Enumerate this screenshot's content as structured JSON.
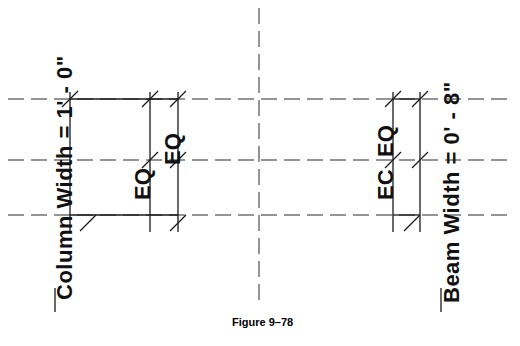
{
  "figure": {
    "caption": "Figure 9–78",
    "caption_x": 232,
    "caption_y": 322
  },
  "colors": {
    "line": "#1a1a1a",
    "dashed": "#2b2b2b",
    "background": "#ffffff",
    "text": "#111111"
  },
  "labels": {
    "column_width": "Column Width = 1' - 0\"",
    "eq_left": "EQ",
    "eq_right": "EQ",
    "ec_left": "EC",
    "eq_inner": "EQ",
    "beam_width": "Beam Width = 0' - 8\""
  },
  "diagram": {
    "type": "dimensioned-plan-detail",
    "dashed_horizontal_lines_y": [
      99,
      160,
      215
    ],
    "dashed_vertical_lines_x": [
      259
    ],
    "solid_vertical_lines_x": [
      70,
      150,
      178,
      393,
      420
    ],
    "tick_angle_deg": 45
  }
}
